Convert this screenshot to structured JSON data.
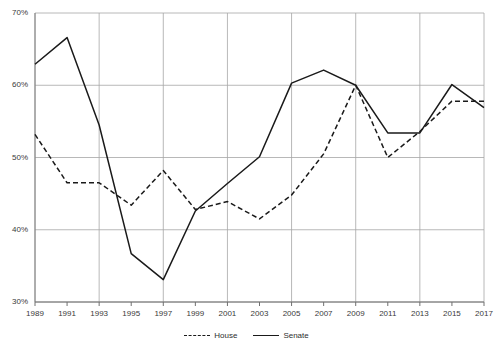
{
  "chart_data": {
    "type": "line",
    "title": "",
    "xlabel": "",
    "ylabel": "",
    "x": [
      1989,
      1991,
      1993,
      1995,
      1997,
      1999,
      2001,
      2003,
      2005,
      2007,
      2009,
      2011,
      2013,
      2015,
      2017
    ],
    "categories": [
      "1989",
      "1991",
      "1993",
      "1995",
      "1997",
      "1999",
      "2001",
      "2003",
      "2005",
      "2007",
      "2009",
      "2011",
      "2013",
      "2015",
      "2017"
    ],
    "series": [
      {
        "name": "House",
        "style": "dashed",
        "color": "#1a1a1a",
        "values": [
          53.2,
          46.5,
          46.5,
          43.4,
          48.2,
          42.8,
          43.9,
          41.5,
          44.8,
          50.5,
          60.0,
          50.0,
          53.6,
          57.8,
          57.8
        ]
      },
      {
        "name": "Senate",
        "style": "solid",
        "color": "#1a1a1a",
        "values": [
          62.9,
          66.6,
          54.5,
          36.7,
          33.1,
          42.6,
          46.4,
          50.1,
          60.3,
          62.1,
          60.0,
          53.4,
          53.4,
          60.1,
          56.9
        ]
      }
    ],
    "ylim": [
      30,
      70
    ],
    "yticks": [
      30,
      40,
      50,
      60,
      70
    ],
    "ytick_labels": [
      "30%",
      "40%",
      "50%",
      "60%",
      "70%"
    ],
    "xlim": [
      1989,
      2017
    ],
    "grid": "horizontal-and-vertical",
    "legend_position": "bottom-center",
    "legend_entries": [
      "House",
      "Senate"
    ]
  }
}
